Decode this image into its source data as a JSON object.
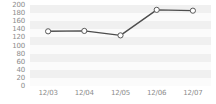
{
  "chart_data": {
    "type": "line",
    "title": "",
    "subtitle": "",
    "xlabel": "",
    "ylabel": "",
    "categories": [
      "12/03",
      "12/04",
      "12/05",
      "12/06",
      "12/07"
    ],
    "values": [
      135,
      136,
      125,
      188,
      186
    ],
    "series": [
      {
        "name": "",
        "values": [
          135,
          136,
          125,
          188,
          186
        ]
      }
    ],
    "ylim": [
      0,
      200
    ],
    "y_ticks": [
      0,
      20,
      40,
      60,
      80,
      100,
      120,
      140,
      160,
      180,
      200
    ],
    "y_tick_labels": [
      "0",
      "20",
      "40",
      "60",
      "80",
      "100",
      "120",
      "140",
      "160",
      "180",
      "200"
    ],
    "x_tick_labels": [
      "12/03",
      "12/04",
      "12/05",
      "12/06",
      "12/07"
    ],
    "grid": "horizontal-bands",
    "legend": "none",
    "annotations": [],
    "marker": "open-circle",
    "colors": {
      "line": "#4d4d4d",
      "marker_fill": "#ffffff",
      "marker_stroke": "#595959",
      "band_light": "#fbfbfb",
      "band_dark": "#f0f0f0",
      "tick_text": "#8c8c8c",
      "background": "#ffffff"
    }
  }
}
